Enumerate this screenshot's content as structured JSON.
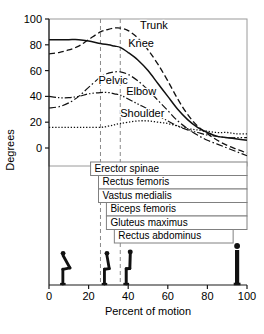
{
  "chart_data": {
    "type": "line",
    "title": "",
    "xlabel": "Percent of motion",
    "ylabel": "Degrees",
    "xlim": [
      0,
      100
    ],
    "ylim": [
      -20,
      100
    ],
    "grid": false,
    "legend_position": "inline-labels",
    "x_ticks": [
      0,
      20,
      40,
      60,
      80,
      100
    ],
    "y_ticks": [
      0,
      20,
      40,
      60,
      80,
      100
    ],
    "annotations": {
      "vertical_lines": [
        26,
        36
      ],
      "note": "Dashed vertical reference lines mark seat-off phase boundaries"
    },
    "series": [
      {
        "name": "Trunk",
        "style": "dashed",
        "label_x": 46,
        "label_y": 92,
        "x": [
          0,
          5,
          10,
          15,
          20,
          26,
          30,
          33,
          36,
          40,
          45,
          50,
          55,
          60,
          65,
          70,
          75,
          80,
          85,
          90,
          95,
          100
        ],
        "y": [
          73,
          74,
          76,
          79,
          84,
          90,
          92,
          93,
          93,
          91,
          85,
          76,
          65,
          52,
          38,
          26,
          17,
          11,
          6,
          2,
          -1,
          -4
        ]
      },
      {
        "name": "Knee",
        "style": "solid",
        "label_x": 40,
        "label_y": 78,
        "x": [
          0,
          5,
          10,
          15,
          20,
          26,
          30,
          33,
          36,
          40,
          45,
          50,
          55,
          60,
          65,
          70,
          75,
          80,
          85,
          90,
          95,
          100
        ],
        "y": [
          84,
          84,
          84,
          84,
          83,
          81,
          80,
          79,
          78,
          74,
          68,
          60,
          50,
          40,
          30,
          22,
          16,
          12,
          9,
          8,
          7,
          6
        ]
      },
      {
        "name": "Pelvic",
        "style": "dash-dot",
        "label_x": 25,
        "label_y": 50,
        "x": [
          0,
          5,
          10,
          15,
          20,
          26,
          30,
          33,
          36,
          40,
          45,
          50,
          55,
          60,
          65,
          70,
          75,
          80,
          85,
          90,
          95,
          100
        ],
        "y": [
          31,
          32,
          35,
          40,
          47,
          55,
          58,
          59,
          59,
          57,
          52,
          45,
          37,
          29,
          21,
          15,
          10,
          6,
          3,
          0,
          -3,
          -6
        ]
      },
      {
        "name": "Elbow",
        "style": "dash-dot-dot",
        "label_x": 39,
        "label_y": 41,
        "x": [
          0,
          5,
          10,
          15,
          20,
          26,
          30,
          33,
          36,
          40,
          45,
          50,
          55,
          60,
          65,
          70,
          75,
          80,
          85,
          90,
          95,
          100
        ],
        "y": [
          40,
          39,
          39,
          40,
          42,
          43,
          43,
          42,
          41,
          38,
          34,
          30,
          25,
          21,
          17,
          14,
          12,
          10,
          9,
          8,
          8,
          8
        ]
      },
      {
        "name": "Shoulder",
        "style": "dotted",
        "label_x": 36,
        "label_y": 24,
        "x": [
          0,
          5,
          10,
          15,
          20,
          26,
          30,
          33,
          36,
          40,
          45,
          50,
          55,
          60,
          65,
          70,
          75,
          80,
          85,
          90,
          95,
          100
        ],
        "y": [
          16,
          16,
          16,
          16,
          16,
          16,
          17,
          18,
          19,
          20,
          21,
          21,
          20,
          19,
          17,
          15,
          14,
          13,
          12,
          12,
          11,
          11
        ]
      }
    ],
    "activity_bars": [
      {
        "label": "Erector spinae",
        "start": 21,
        "end": 100
      },
      {
        "label": "Rectus femoris",
        "start": 25,
        "end": 100
      },
      {
        "label": "Vastus medialis",
        "start": 25,
        "end": 100
      },
      {
        "label": "Biceps femoris",
        "start": 29,
        "end": 100
      },
      {
        "label": "Gluteus maximus",
        "start": 29,
        "end": 100
      },
      {
        "label": "Rectus abdominus",
        "start": 33,
        "end": 93
      }
    ],
    "posture_figures": [
      {
        "name": "seated",
        "x": 7
      },
      {
        "name": "leaning-forward",
        "x": 28
      },
      {
        "name": "seat-off",
        "x": 39
      },
      {
        "name": "standing",
        "x": 95
      }
    ]
  }
}
